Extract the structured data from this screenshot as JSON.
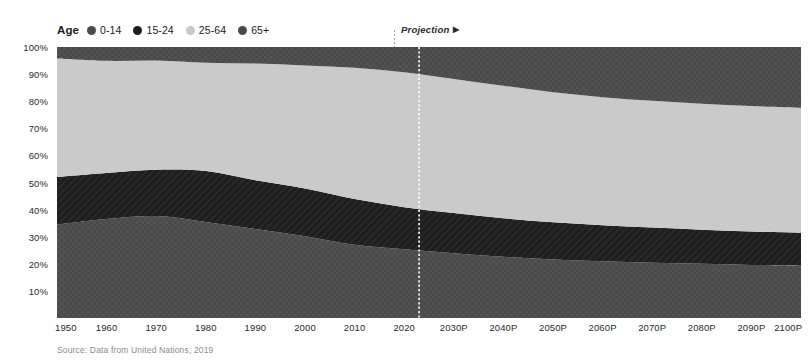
{
  "legend": {
    "title": "Age",
    "items": [
      {
        "label": "0-14",
        "color": "#4a4a4a"
      },
      {
        "label": "15-24",
        "color": "#1d1d1d"
      },
      {
        "label": "25-64",
        "color": "#c9c9c9"
      },
      {
        "label": "65+",
        "color": "#4a4a4a"
      }
    ]
  },
  "projection": {
    "label": "Projection",
    "arrow": "▶",
    "divider_year": 2023
  },
  "source": "Source: Data from United Nations, 2019",
  "chart_data": {
    "type": "area",
    "stacked": true,
    "stack_order_bottom_to_top": [
      "0-14",
      "15-24",
      "25-64",
      "65+"
    ],
    "title": "",
    "subtitle": "",
    "xlabel": "",
    "ylabel": "",
    "xlim": [
      1950,
      2100
    ],
    "ylim": [
      0,
      100
    ],
    "grid": false,
    "legend_position": "top-left",
    "y_ticks": [
      "10%",
      "20%",
      "30%",
      "40%",
      "50%",
      "60%",
      "70%",
      "80%",
      "90%",
      "100%"
    ],
    "y_tick_values": [
      10,
      20,
      30,
      40,
      50,
      60,
      70,
      80,
      90,
      100
    ],
    "x_ticks": [
      "1950",
      "1960",
      "1970",
      "1980",
      "1990",
      "2000",
      "2010",
      "2020",
      "2030P",
      "2040P",
      "2050P",
      "2060P",
      "2070P",
      "2080P",
      "2090P",
      "2100P"
    ],
    "x": [
      1950,
      1960,
      1970,
      1980,
      1990,
      2000,
      2010,
      2020,
      2030,
      2040,
      2050,
      2060,
      2070,
      2080,
      2090,
      2100
    ],
    "series": [
      {
        "name": "0-14",
        "color": "#4a4a4a",
        "values": [
          34.5,
          36.5,
          37.6,
          35.4,
          32.8,
          30.2,
          27.0,
          25.4,
          23.9,
          22.6,
          21.6,
          20.9,
          20.4,
          20.0,
          19.6,
          19.3
        ]
      },
      {
        "name": "15-24",
        "color": "#1d1d1d",
        "values": [
          17.5,
          17.0,
          17.1,
          18.8,
          18.0,
          17.6,
          16.9,
          15.5,
          14.8,
          14.2,
          13.7,
          13.3,
          13.0,
          12.6,
          12.3,
          12.1
        ]
      },
      {
        "name": "25-64",
        "color": "#c9c9c9",
        "values": [
          43.8,
          41.4,
          40.3,
          40.0,
          43.1,
          45.4,
          48.4,
          49.8,
          49.5,
          48.9,
          48.0,
          47.3,
          46.8,
          46.5,
          46.3,
          46.2
        ]
      },
      {
        "name": "65+",
        "color": "#4a4a4a",
        "values": [
          4.2,
          5.1,
          5.0,
          5.8,
          6.1,
          6.8,
          7.7,
          9.3,
          11.8,
          14.3,
          16.7,
          18.5,
          19.8,
          20.9,
          21.8,
          22.4
        ]
      }
    ]
  }
}
